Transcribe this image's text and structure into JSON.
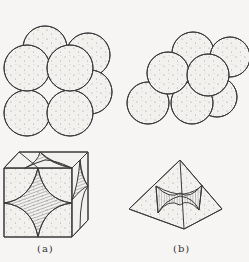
{
  "figure": {
    "panels": [
      {
        "id": "a",
        "label": "(a)",
        "description": "Cubic packing of spheres and the cubic interstitial void",
        "spheres": [
          {
            "cx": 45,
            "cy": 48,
            "r": 22
          },
          {
            "cx": 88,
            "cy": 55,
            "r": 22
          },
          {
            "cx": 90,
            "cy": 92,
            "r": 22
          },
          {
            "cx": 27,
            "cy": 113,
            "r": 23
          },
          {
            "cx": 70,
            "cy": 113,
            "r": 23
          },
          {
            "cx": 27,
            "cy": 68,
            "r": 23
          },
          {
            "cx": 70,
            "cy": 68,
            "r": 23
          }
        ]
      },
      {
        "id": "b",
        "label": "(b)",
        "description": "Close packing of spheres and the octahedral interstitial void",
        "spheres": [
          {
            "cx": 193,
            "cy": 53,
            "r": 21
          },
          {
            "cx": 230,
            "cy": 57,
            "r": 20
          },
          {
            "cx": 217,
            "cy": 97,
            "r": 20
          },
          {
            "cx": 148,
            "cy": 103,
            "r": 21
          },
          {
            "cx": 192,
            "cy": 103,
            "r": 21
          },
          {
            "cx": 168,
            "cy": 73,
            "r": 21
          },
          {
            "cx": 208,
            "cy": 75,
            "r": 21
          }
        ]
      }
    ],
    "colors": {
      "background": "#f6f5f3",
      "stroke": "#3a3a3a",
      "fill": "#f2f1ee",
      "stipple": "#8a8a8a"
    }
  }
}
